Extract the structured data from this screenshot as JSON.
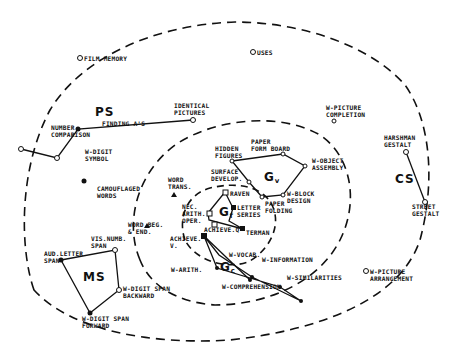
{
  "diagram": {
    "type": "radex",
    "regions": {
      "outer": "outer-dashed-boundary",
      "middle": "middle-dashed-boundary",
      "inner": "inner-dashed-boundary"
    },
    "clusters": {
      "ps": {
        "label": "PS"
      },
      "ms": {
        "label": "MS"
      },
      "cs": {
        "label": "CS"
      },
      "gv": {
        "label": "G",
        "sub": "v"
      },
      "gf": {
        "label": "G",
        "sub": "f"
      },
      "gc": {
        "label": "G",
        "sub": "c"
      }
    },
    "tests": {
      "film_memory": "FILM MEMORY",
      "uses": "USES",
      "identical_pictures": "IDENTICAL\nPICTURES",
      "finding_as": "FINDING A'S",
      "number_comparison": "NUMBER\nCOMPARISON",
      "w_digit_symbol": "W-DIGIT\nSYMBOL",
      "camouflaged_words": "CAMOUFLAGED\nWORDS",
      "w_picture_completion": "W-PICTURE\nCOMPLETION",
      "harshman_gestalt": "HARSHMAN\nGESTALT",
      "street_gestalt": "STREET\nGESTALT",
      "hidden_figures": "HIDDEN\nFIGURES",
      "paper_form_board": "PAPER\nFORM BOARD",
      "w_object_assembly": "W-OBJECT\nASSEMBLY",
      "surface_develop": "SURFACE\nDEVELOP.",
      "w_block_design": "W-BLOCK\nDESIGN",
      "paper_folding": "PAPER\nFOLDING",
      "word_trans": "WORD\nTRANS.",
      "raven": "RAVEN",
      "letter_series": "LETTER\nSERIES",
      "nec_arith_oper": "NEC.\nARITH.\nOPER.",
      "achieve_q": "ACHIEVE.Q",
      "terman": "TERMAN",
      "word_beg_end": "WORD BEG.\n& END.",
      "achieve_v": "ACHIEVE.\nV.",
      "vis_numb_span": "VIS.NUMB.\nSPAN",
      "aud_letter_span": "AUD.LETTER\nSPAN",
      "w_vocab": "W-VOCAB.",
      "w_information": "W-INFORMATION",
      "w_arith": "W-ARITH.",
      "w_similarities": "W-SIMILARITIES",
      "w_comprehension": "W-COMPREHENSION",
      "w_digit_span_backward": "W-DIGIT SPAN\nBACKWARD",
      "w_digit_span_forward": "W-DIGIT SPAN\nFORWARD",
      "w_picture_arrangement": "W-PICTURE\nARRANGEMENT"
    },
    "colors": {
      "ink": "#111111",
      "background": "#ffffff"
    }
  }
}
